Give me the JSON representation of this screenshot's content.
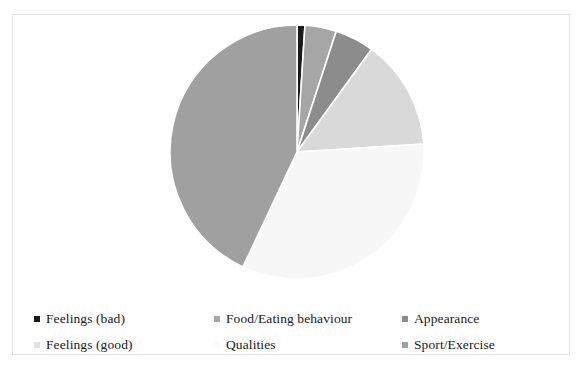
{
  "chart_data": {
    "type": "pie",
    "title": "",
    "legend_position": "bottom",
    "start_angle_deg": 0,
    "direction": "clockwise",
    "categories": [
      "Feelings (bad)",
      "Food/Eating behaviour",
      "Appearance",
      "Feelings (good)",
      "Qualities",
      "Sport/Exercise"
    ],
    "values": [
      1,
      4,
      5,
      14,
      33,
      43
    ],
    "value_unit": "percent",
    "colors": [
      "#1a1a1a",
      "#a6a6a6",
      "#8c8c8c",
      "#d9d9d9",
      "#f7f7f7",
      "#a0a0a0"
    ],
    "slices": [
      {
        "label": "Feelings (bad)",
        "value": 1,
        "color": "#1a1a1a"
      },
      {
        "label": "Food/Eating behaviour",
        "value": 4,
        "color": "#a6a6a6"
      },
      {
        "label": "Appearance",
        "value": 5,
        "color": "#8c8c8c"
      },
      {
        "label": "Feelings (good)",
        "value": 14,
        "color": "#d9d9d9"
      },
      {
        "label": "Qualities",
        "value": 33,
        "color": "#f7f7f7"
      },
      {
        "label": "Sport/Exercise",
        "value": 43,
        "color": "#a0a0a0"
      }
    ],
    "slice_gap_color": "#ffffff",
    "xlabel": "",
    "ylabel": ""
  },
  "legend": {
    "items": [
      {
        "label": "Feelings (bad)",
        "color": "#1a1a1a"
      },
      {
        "label": "Food/Eating behaviour",
        "color": "#a6a6a6"
      },
      {
        "label": "Appearance",
        "color": "#8c8c8c"
      },
      {
        "label": "Feelings (good)",
        "color": "#e2e2e2"
      },
      {
        "label": "Qualities",
        "color": "#fafafa"
      },
      {
        "label": "Sport/Exercise",
        "color": "#a0a0a0"
      }
    ]
  }
}
